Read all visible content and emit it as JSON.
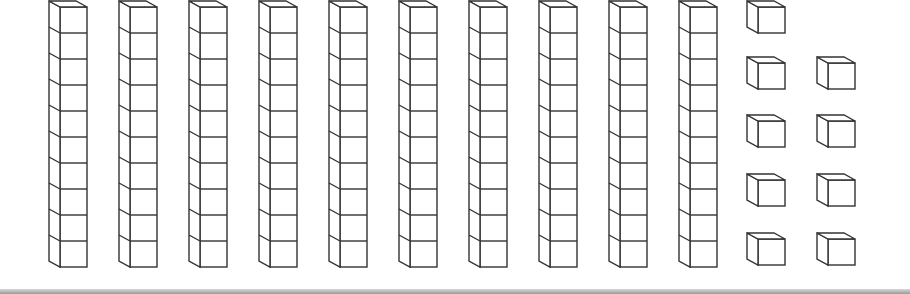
{
  "colors": {
    "stroke": "#333333",
    "fill": "#ffffff",
    "bar": "#a0a0a0"
  },
  "tens": {
    "count": 10,
    "cubes_per_rod": 10,
    "x_positions": [
      49,
      119,
      189,
      259,
      329,
      399,
      469,
      539,
      609,
      679
    ]
  },
  "ones": {
    "count": 9,
    "positions": [
      [
        747,
        0
      ],
      [
        747,
        56
      ],
      [
        817,
        56
      ],
      [
        747,
        114
      ],
      [
        817,
        114
      ],
      [
        747,
        173
      ],
      [
        817,
        173
      ],
      [
        747,
        232
      ],
      [
        817,
        232
      ]
    ]
  },
  "total_value": 109
}
